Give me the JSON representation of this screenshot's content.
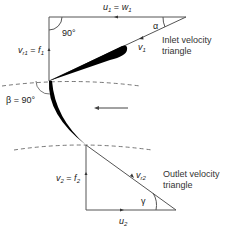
{
  "diagram": {
    "type": "velocity-triangles",
    "labels": {
      "inlet_top": {
        "base": "u",
        "sub": "1",
        "eq": " = ",
        "base2": "w",
        "sub2": "1"
      },
      "inlet_right_angle": "90°",
      "inlet_alpha": "α",
      "inlet_vertical": {
        "base": "v",
        "sub": "r1",
        "eq": " = ",
        "base2": "f",
        "sub2": "1"
      },
      "inlet_hyp": {
        "base": "v",
        "sub": "1"
      },
      "inlet_title_line1": "Inlet velocity",
      "inlet_title_line2": "triangle",
      "beta": "β = 90°",
      "outlet_vertical": {
        "base": "v",
        "sub": "2",
        "eq": " = ",
        "base2": "f",
        "sub2": "2"
      },
      "outlet_hyp": {
        "base": "v",
        "sub": "r2"
      },
      "outlet_gamma": "γ",
      "outlet_bottom": {
        "base": "u",
        "sub": "2"
      },
      "outlet_title_line1": "Outlet velocity",
      "outlet_title_line2": "triangle"
    },
    "colors": {
      "line": "#555555",
      "blade": "#000000",
      "text": "#222222"
    }
  }
}
